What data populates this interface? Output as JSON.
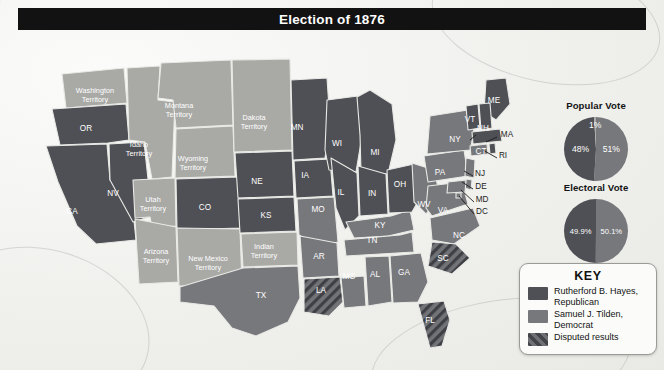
{
  "header": {
    "title": "Election of 1876"
  },
  "colors": {
    "hayes": "#4f5055",
    "tilden": "#77787c",
    "territory": "#a9a9a6",
    "disputed_base": "#6e6f73",
    "disputed_stripe": "#43444a",
    "water": "#f4f4f1",
    "border": "#e9e9e6",
    "title_bg": "#121212",
    "title_fg": "#ffffff",
    "key_bg": "#fbfbf9",
    "key_border": "#9a9a96"
  },
  "charts": [
    {
      "id": "popular-vote",
      "title": "Popular Vote",
      "type": "pie",
      "slices": [
        {
          "label": "51%",
          "value": 51,
          "color_key": "tilden"
        },
        {
          "label": "48%",
          "value": 48,
          "color_key": "hayes"
        },
        {
          "label": "1%",
          "value": 1,
          "color_key": "territory"
        }
      ]
    },
    {
      "id": "electoral-vote",
      "title": "Electoral Vote",
      "type": "pie",
      "slices": [
        {
          "label": "50.1%",
          "value": 50.1,
          "color_key": "tilden"
        },
        {
          "label": "49.9%",
          "value": 49.9,
          "color_key": "hayes"
        }
      ]
    }
  ],
  "chart_data": [
    {
      "type": "pie",
      "title": "Popular Vote",
      "categories": [
        "Samuel J. Tilden, Democrat",
        "Rutherford B. Hayes, Republican",
        "Other"
      ],
      "values": [
        51,
        48,
        1
      ],
      "labels": [
        "51%",
        "48%",
        "1%"
      ],
      "legend": "position: external key",
      "xlabel": "",
      "ylabel": ""
    },
    {
      "type": "pie",
      "title": "Electoral Vote",
      "categories": [
        "Rutherford B. Hayes, Republican",
        "Samuel J. Tilden, Democrat"
      ],
      "values": [
        50.1,
        49.9
      ],
      "labels": [
        "50.1%",
        "49.9%"
      ],
      "legend": "position: external key",
      "xlabel": "",
      "ylabel": ""
    }
  ],
  "key": {
    "title": "KEY",
    "items": [
      {
        "label": "Rutherford B. Hayes, Republican",
        "swatch": "hayes"
      },
      {
        "label": "Samuel J. Tilden, Democrat",
        "swatch": "tilden"
      },
      {
        "label": "Disputed results",
        "swatch": "disputed"
      }
    ]
  },
  "map": {
    "title": "Election of 1876",
    "states": [
      {
        "id": "WA",
        "label": "Washington\nTerritory",
        "fill": "territory",
        "lx": 95,
        "ly": 63
      },
      {
        "id": "OR",
        "label": "OR",
        "fill": "hayes",
        "lx": 86,
        "ly": 101
      },
      {
        "id": "CA",
        "label": "CA",
        "fill": "hayes",
        "lx": 72,
        "ly": 184
      },
      {
        "id": "NV",
        "label": "NV",
        "fill": "hayes",
        "lx": 113,
        "ly": 166
      },
      {
        "id": "ID",
        "label": "Idaho\nTerritory",
        "fill": "territory",
        "lx": 139,
        "ly": 117
      },
      {
        "id": "MT",
        "label": "Montana\nTerritory",
        "fill": "territory",
        "lx": 179,
        "ly": 78
      },
      {
        "id": "WY",
        "label": "Wyoming\nTerritory",
        "fill": "territory",
        "lx": 193,
        "ly": 131
      },
      {
        "id": "UT",
        "label": "Utah\nTerritory",
        "fill": "territory",
        "lx": 153,
        "ly": 172
      },
      {
        "id": "CO",
        "label": "CO",
        "fill": "hayes",
        "lx": 205,
        "ly": 180
      },
      {
        "id": "AZ",
        "label": "Arizona\nTerritory",
        "fill": "territory",
        "lx": 156,
        "ly": 224
      },
      {
        "id": "NM",
        "label": "New Mexico\nTerritory",
        "fill": "territory",
        "lx": 208,
        "ly": 231
      },
      {
        "id": "DT",
        "label": "Dakota\nTerritory",
        "fill": "territory",
        "lx": 254,
        "ly": 90
      },
      {
        "id": "NE",
        "label": "NE",
        "fill": "hayes",
        "lx": 257,
        "ly": 154
      },
      {
        "id": "KS",
        "label": "KS",
        "fill": "hayes",
        "lx": 266,
        "ly": 188
      },
      {
        "id": "IT",
        "label": "Indian\nTerritory",
        "fill": "territory",
        "lx": 264,
        "ly": 219
      },
      {
        "id": "TX",
        "label": "TX",
        "fill": "tilden",
        "lx": 261,
        "ly": 268
      },
      {
        "id": "MN",
        "label": "MN",
        "fill": "hayes",
        "lx": 297,
        "ly": 100
      },
      {
        "id": "IA",
        "label": "IA",
        "fill": "hayes",
        "lx": 305,
        "ly": 148
      },
      {
        "id": "MO",
        "label": "MO",
        "fill": "tilden",
        "lx": 318,
        "ly": 182
      },
      {
        "id": "AR",
        "label": "AR",
        "fill": "tilden",
        "lx": 319,
        "ly": 229
      },
      {
        "id": "LA",
        "label": "LA",
        "fill": "disputed",
        "lx": 321,
        "ly": 263
      },
      {
        "id": "WI",
        "label": "WI",
        "fill": "hayes",
        "lx": 337,
        "ly": 116
      },
      {
        "id": "IL",
        "label": "IL",
        "fill": "hayes",
        "lx": 341,
        "ly": 165
      },
      {
        "id": "MS",
        "label": "MS",
        "fill": "tilden",
        "lx": 349,
        "ly": 249
      },
      {
        "id": "MI",
        "label": "MI",
        "fill": "hayes",
        "lx": 375,
        "ly": 125
      },
      {
        "id": "IN",
        "label": "IN",
        "fill": "hayes",
        "lx": 372,
        "ly": 166
      },
      {
        "id": "KY",
        "label": "KY",
        "fill": "tilden",
        "lx": 380,
        "ly": 198
      },
      {
        "id": "TN",
        "label": "TN",
        "fill": "tilden",
        "lx": 372,
        "ly": 213
      },
      {
        "id": "AL",
        "label": "AL",
        "fill": "tilden",
        "lx": 375,
        "ly": 247
      },
      {
        "id": "GA",
        "label": "GA",
        "fill": "tilden",
        "lx": 404,
        "ly": 245
      },
      {
        "id": "OH",
        "label": "OH",
        "fill": "hayes",
        "lx": 400,
        "ly": 157
      },
      {
        "id": "WV",
        "label": "WV",
        "fill": "tilden",
        "lx": 424,
        "ly": 177
      },
      {
        "id": "VA",
        "label": "VA",
        "fill": "tilden",
        "lx": 443,
        "ly": 183
      },
      {
        "id": "NC",
        "label": "NC",
        "fill": "tilden",
        "lx": 459,
        "ly": 208
      },
      {
        "id": "SC",
        "label": "SC",
        "fill": "disputed",
        "lx": 443,
        "ly": 231
      },
      {
        "id": "FL",
        "label": "FL",
        "fill": "disputed",
        "lx": 430,
        "ly": 293
      },
      {
        "id": "PA",
        "label": "PA",
        "fill": "tilden",
        "lx": 440,
        "ly": 145
      },
      {
        "id": "NY",
        "label": "NY",
        "fill": "tilden",
        "lx": 455,
        "ly": 112
      },
      {
        "id": "ME",
        "label": "ME",
        "fill": "hayes",
        "lx": 494,
        "ly": 73
      },
      {
        "id": "VT",
        "label": "VT",
        "fill": "hayes",
        "lx": 470,
        "ly": 92
      },
      {
        "id": "NH",
        "label": "NH",
        "fill": "hayes",
        "lx": 483,
        "ly": 101
      },
      {
        "id": "MA",
        "label": "MA",
        "fill": "hayes",
        "lx": 507,
        "ly": 107
      },
      {
        "id": "CT",
        "label": "CT",
        "fill": "tilden",
        "lx": 481,
        "ly": 124
      },
      {
        "id": "RI",
        "label": "RI",
        "fill": "hayes",
        "lx": 503,
        "ly": 128
      },
      {
        "id": "NJ",
        "label": "NJ",
        "fill": "tilden",
        "lx": 480,
        "ly": 146
      },
      {
        "id": "DE",
        "label": "DE",
        "fill": "tilden",
        "lx": 481,
        "ly": 159
      },
      {
        "id": "MD",
        "label": "MD",
        "fill": "tilden",
        "lx": 482,
        "ly": 172
      },
      {
        "id": "DC",
        "label": "DC",
        "fill": "tilden",
        "lx": 482,
        "ly": 184
      }
    ]
  }
}
